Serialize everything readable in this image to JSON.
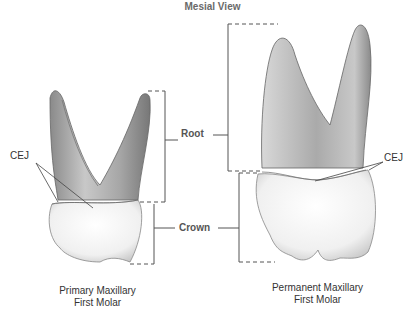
{
  "title": "Mesial View",
  "labels": {
    "root": "Root",
    "crown": "Crown",
    "cej_left": "CEJ",
    "cej_right": "CEJ"
  },
  "captions": {
    "primary": {
      "line1": "Primary Maxillary",
      "line2": "First Molar"
    },
    "permanent": {
      "line1": "Permanent Maxillary",
      "line2": "First Molar"
    }
  },
  "colors": {
    "background": "#ffffff",
    "line": "#555555",
    "root_shade": "#9a9a9a",
    "crown_shade": "#f2f2f2"
  }
}
